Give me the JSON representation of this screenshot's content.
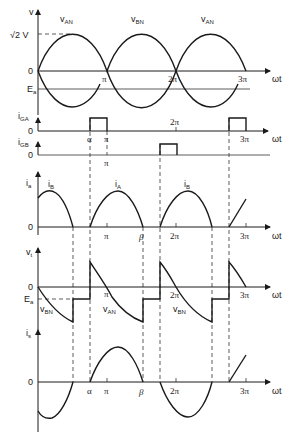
{
  "figure": {
    "x_axis_label": "ωt",
    "x_ticks": [
      "π",
      "2π",
      "3π"
    ],
    "angle_marks": {
      "alpha": "α",
      "beta": "β"
    },
    "line_color": "#1a1a1a",
    "background": "#ffffff"
  },
  "panels": {
    "supply": {
      "y_label": "v",
      "peak_label": "√2 V",
      "zero_label": "0",
      "ea_label": "E",
      "ea_sub": "a",
      "curves": [
        {
          "label": "v",
          "sub": "AN"
        },
        {
          "label": "v",
          "sub": "BN"
        },
        {
          "label": "v",
          "sub": "AN"
        }
      ]
    },
    "gate_a": {
      "y_label": "i",
      "y_sub": "GA",
      "zero_label": "0"
    },
    "gate_b": {
      "y_label": "i",
      "y_sub": "GB",
      "zero_label": "0"
    },
    "armature_current": {
      "y_label": "i",
      "y_sub": "a",
      "zero_label": "0",
      "curves": [
        {
          "label": "i",
          "sub": "B"
        },
        {
          "label": "i",
          "sub": "A"
        },
        {
          "label": "i",
          "sub": "B"
        }
      ]
    },
    "terminal_voltage": {
      "y_label": "v",
      "y_sub": "t",
      "zero_label": "0",
      "ea_label": "E",
      "ea_sub": "a",
      "curves": [
        {
          "label": "v",
          "sub": "BN"
        },
        {
          "label": "v",
          "sub": "AN"
        },
        {
          "label": "v",
          "sub": "BN"
        }
      ]
    },
    "supply_current": {
      "y_label": "i",
      "y_sub": "s",
      "zero_label": "0"
    }
  }
}
